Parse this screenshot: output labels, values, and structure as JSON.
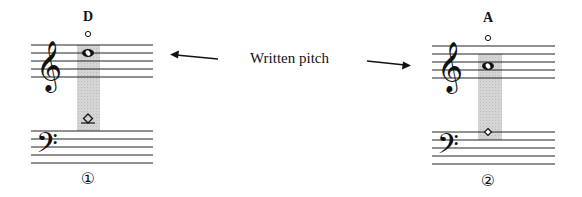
{
  "caption": "Written pitch",
  "examples": [
    {
      "number": "①",
      "note_name": "D",
      "harmonic_type": "natural harmonic",
      "written_note": "whole note D5",
      "touch_note": "diamond"
    },
    {
      "number": "②",
      "note_name": "A",
      "harmonic_type": "artificial harmonic",
      "written_note": "whole note A4",
      "touch_note": "diamond"
    }
  ],
  "colors": {
    "ink": "#111111",
    "highlight": "#cfcfcf",
    "background": "#ffffff"
  }
}
